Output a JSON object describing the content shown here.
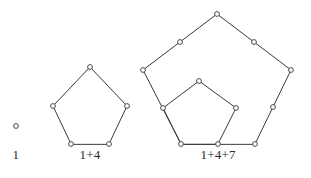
{
  "figure": {
    "colors": {
      "background": "#ffffff",
      "edge": "#3a3a3a",
      "node_fill": "#ffffff",
      "node_stroke": "#4a4a4a",
      "caption_text": "#2b2b2b"
    },
    "node_radius": 2.4,
    "groups": [
      {
        "id": "group-1",
        "caption": "1",
        "caption_x": 16,
        "caption_y": 158,
        "dot_count": 1,
        "pentagons": [],
        "nodes": [
          {
            "name": "origin-dot",
            "x": 16,
            "y": 126
          }
        ]
      },
      {
        "id": "group-2",
        "caption": "1+4",
        "caption_x": 90,
        "caption_y": 158,
        "dot_count": 5,
        "pentagons": [
          {
            "name": "pentagon-ring-1",
            "points": "71,144 53,106 90,67 127,106 109,144"
          }
        ],
        "nodes": [
          {
            "name": "vertex-bottom-left",
            "x": 71,
            "y": 144
          },
          {
            "name": "vertex-left",
            "x": 53,
            "y": 106
          },
          {
            "name": "vertex-apex",
            "x": 90,
            "y": 67
          },
          {
            "name": "vertex-right",
            "x": 127,
            "y": 106
          },
          {
            "name": "vertex-bottom-right",
            "x": 109,
            "y": 144
          }
        ]
      },
      {
        "id": "group-3",
        "caption": "1+4+7",
        "caption_x": 218,
        "caption_y": 158,
        "dot_count": 12,
        "pentagons": [
          {
            "name": "pentagon-ring-1-inner",
            "points": "181,144 163,108 199,81 236,108 218,144"
          },
          {
            "name": "pentagon-ring-2-outer",
            "points": "181,144 143,70 217,14 291,70 255,144"
          }
        ],
        "nodes": [
          {
            "name": "vertex-shared-bottom-left",
            "x": 181,
            "y": 144
          },
          {
            "name": "vertex-inner-left",
            "x": 163,
            "y": 108
          },
          {
            "name": "vertex-inner-apex",
            "x": 199,
            "y": 81
          },
          {
            "name": "vertex-inner-right",
            "x": 236,
            "y": 108
          },
          {
            "name": "vertex-inner-bottom-right",
            "x": 218,
            "y": 144
          },
          {
            "name": "vertex-outer-left",
            "x": 143,
            "y": 70
          },
          {
            "name": "vertex-outer-upper-left-mid",
            "x": 180,
            "y": 42
          },
          {
            "name": "vertex-outer-apex",
            "x": 217,
            "y": 14
          },
          {
            "name": "vertex-outer-upper-right-mid",
            "x": 254,
            "y": 42
          },
          {
            "name": "vertex-outer-right",
            "x": 291,
            "y": 70
          },
          {
            "name": "vertex-outer-lower-right-mid",
            "x": 273,
            "y": 107
          },
          {
            "name": "vertex-outer-bottom-right",
            "x": 255,
            "y": 144
          }
        ]
      }
    ]
  }
}
